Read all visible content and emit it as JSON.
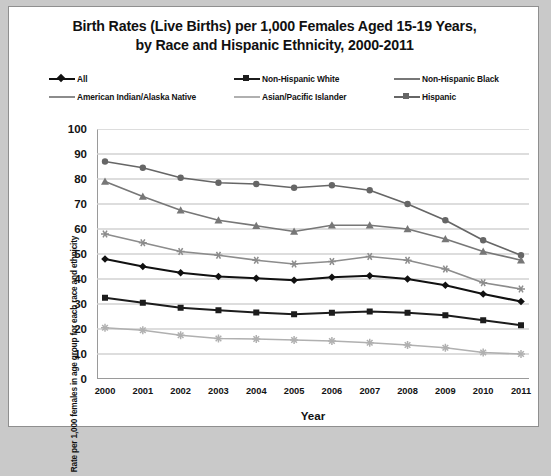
{
  "chart_data": {
    "type": "line",
    "title": "Birth Rates (Live Births) per 1,000 Females Aged 15-19 Years, by Race and Hispanic Ethnicity, 2000-2011",
    "title_line1": "Birth Rates (Live Births) per 1,000 Females Aged 15-19 Years,",
    "title_line2": "by Race and Hispanic Ethnicity, 2000-2011",
    "xlabel": "Year",
    "ylabel": "Rate per 1,000 females in age group for each race and ethnicity",
    "categories": [
      "2000",
      "2001",
      "2002",
      "2003",
      "2004",
      "2005",
      "2006",
      "2007",
      "2008",
      "2009",
      "2010",
      "2011"
    ],
    "ylim": [
      0,
      100
    ],
    "yticks": [
      "100",
      "90",
      "80",
      "70",
      "60",
      "50",
      "40",
      "30",
      "20",
      "10",
      "0"
    ],
    "grid": true,
    "legend_position": "top",
    "series": [
      {
        "name": "All",
        "color": "#111111",
        "marker": "diamond",
        "values": [
          48.0,
          45.0,
          42.5,
          41.0,
          40.3,
          39.5,
          40.7,
          41.3,
          40.0,
          37.5,
          34.0,
          31.0
        ]
      },
      {
        "name": "Non-Hispanic White",
        "color": "#1c1c1c",
        "marker": "square",
        "values": [
          32.5,
          30.5,
          28.5,
          27.5,
          26.6,
          25.9,
          26.5,
          27.0,
          26.5,
          25.5,
          23.5,
          21.5
        ]
      },
      {
        "name": "Non-Hispanic Black",
        "color": "#777777",
        "marker": "triangle",
        "values": [
          79.0,
          73.0,
          67.5,
          63.5,
          61.3,
          59.0,
          61.5,
          61.5,
          60.0,
          56.0,
          51.0,
          47.5
        ]
      },
      {
        "name": "American Indian/Alaska Native",
        "color": "#8c8c8c",
        "marker": "star",
        "values": [
          58.0,
          54.5,
          51.0,
          49.5,
          47.5,
          46.0,
          47.0,
          49.0,
          47.5,
          44.0,
          38.5,
          36.0
        ]
      },
      {
        "name": "Asian/Pacific Islander",
        "color": "#b0b0b0",
        "marker": "asterisk",
        "values": [
          20.5,
          19.5,
          17.5,
          16.2,
          16.0,
          15.6,
          15.2,
          14.5,
          13.6,
          12.5,
          10.6,
          10.0
        ]
      },
      {
        "name": "Hispanic",
        "color": "#666666",
        "marker": "circle",
        "values": [
          87.0,
          84.5,
          80.5,
          78.5,
          78.0,
          76.5,
          77.5,
          75.5,
          70.0,
          63.5,
          55.5,
          49.5
        ]
      }
    ]
  },
  "legend": {
    "items": [
      {
        "label": "All",
        "color": "#111111",
        "marker": "diamond",
        "x": 0,
        "y": 0
      },
      {
        "label": "Non-Hispanic White",
        "color": "#1c1c1c",
        "marker": "square",
        "x": 185,
        "y": 0
      },
      {
        "label": "Non-Hispanic Black",
        "color": "#777777",
        "marker": "asterisk",
        "x": 345,
        "y": 0
      },
      {
        "label": "American Indian/Alaska Native",
        "color": "#8c8c8c",
        "marker": "star",
        "x": 0,
        "y": 18
      },
      {
        "label": "Asian/Pacific Islander",
        "color": "#b0b0b0",
        "marker": "asterisk",
        "x": 185,
        "y": 18
      },
      {
        "label": "Hispanic",
        "color": "#666666",
        "marker": "square",
        "x": 345,
        "y": 18
      }
    ]
  },
  "colors": {
    "background": "#ffffff",
    "page": "#c9c9c9",
    "frame_border": "#8f8f8f",
    "axis": "#9a9a9a",
    "gridline": "#d2d2d2",
    "text": "#121212"
  }
}
